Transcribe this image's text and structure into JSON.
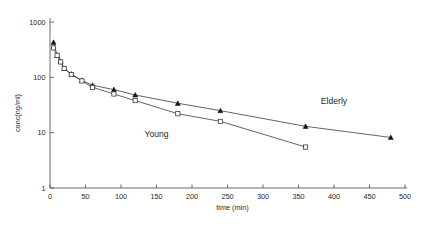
{
  "chart_data": {
    "type": "line",
    "title": "",
    "xlabel": "time (min)",
    "ylabel": "conc(ng/ml)",
    "yscale": "log",
    "xscale": "linear",
    "xlim": [
      0,
      500
    ],
    "ylim": [
      1,
      1000
    ],
    "xticks": [
      0,
      50,
      100,
      150,
      200,
      250,
      300,
      350,
      400,
      450,
      500
    ],
    "yticks": [
      1,
      10,
      100,
      1000
    ],
    "ytick_labels": [
      "1",
      "10",
      "100",
      "1000"
    ],
    "grid": false,
    "legend_position": "inline-annotations",
    "series": [
      {
        "name": "Elderly",
        "marker": "filled-triangle",
        "label_x": 400,
        "label_y": 33,
        "x": [
          5,
          10,
          15,
          20,
          30,
          45,
          60,
          90,
          120,
          180,
          240,
          360,
          480
        ],
        "y": [
          430,
          250,
          195,
          145,
          115,
          88,
          72,
          60,
          48,
          34,
          25,
          13,
          8.2
        ]
      },
      {
        "name": "Young",
        "marker": "open-square",
        "label_x": 150,
        "label_y": 8.5,
        "x": [
          5,
          10,
          15,
          20,
          30,
          45,
          60,
          90,
          120,
          180,
          240,
          360
        ],
        "y": [
          340,
          250,
          190,
          145,
          112,
          86,
          66,
          50,
          38,
          22,
          16,
          5.5
        ]
      }
    ]
  }
}
